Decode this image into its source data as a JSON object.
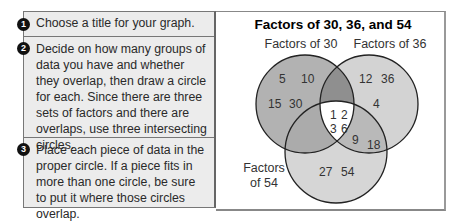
{
  "steps": [
    {
      "number": "1",
      "text": "Choose a title for your graph."
    },
    {
      "number": "2",
      "text": "Decide on how many groups of data you have and whether they overlap, then draw a circle for each. Since there are three sets of factors and there are overlaps, use three intersecting circles."
    },
    {
      "number": "3",
      "text": "Place each piece of data in the proper circle. If a piece fits in more than one circle, be sure to put it where those circles overlap."
    }
  ],
  "venn": {
    "title": "Factors of 30, 36, and 54",
    "sets": {
      "a_label": "Factors of 30",
      "b_label": "Factors of 36",
      "c_label_line1": "Factors",
      "c_label_line2": "of 54"
    },
    "regions": {
      "a_only": [
        "5",
        "10",
        "15",
        "30"
      ],
      "b_only": [
        "12",
        "36",
        "4"
      ],
      "c_only": [
        "27",
        "54"
      ],
      "b_and_c": [
        "9",
        "18"
      ],
      "all_three": [
        "1",
        "2",
        "3",
        "6"
      ]
    },
    "colors": {
      "a_only": "#b2b2b2",
      "b_only": "#d3d3d3",
      "c_only": "#d6d6d6",
      "a_and_b": "#8f8f8f",
      "a_and_c": "#ababab",
      "b_and_c": "#b9b9b9",
      "all_three": "#ffffff",
      "outline": "#222222"
    }
  }
}
